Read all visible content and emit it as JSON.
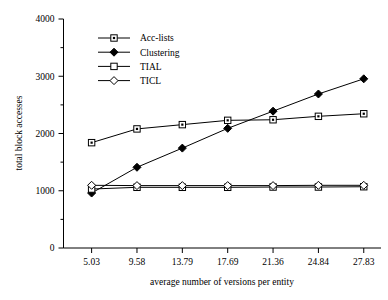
{
  "chart_data": {
    "type": "line",
    "title": "",
    "xlabel": "average number of versions per entity",
    "ylabel": "total block accesses",
    "categories": [
      "5.03",
      "9.58",
      "13.79",
      "17.69",
      "21.36",
      "24.84",
      "27.83"
    ],
    "x_tick_labels": [
      "5.03",
      "9.58",
      "13.79",
      "17.69",
      "21.36",
      "24.84",
      "27.83"
    ],
    "y_tick_labels": [
      "0",
      "1000",
      "2000",
      "3000",
      "4000"
    ],
    "y_tick_values": [
      0,
      1000,
      2000,
      3000,
      4000
    ],
    "y_minor_tick_values": [
      500,
      1500,
      2500,
      3500
    ],
    "ylim": [
      0,
      4000
    ],
    "grid": false,
    "legend_position": "top-left-inside",
    "series": [
      {
        "name": "Acc-lists",
        "marker": "square-dot",
        "values": [
          1840,
          2080,
          2155,
          2230,
          2240,
          2300,
          2345
        ]
      },
      {
        "name": "Clustering",
        "marker": "diamond-filled",
        "values": [
          960,
          1410,
          1745,
          2090,
          2390,
          2690,
          2955
        ]
      },
      {
        "name": "TIAL",
        "marker": "square-open",
        "values": [
          1030,
          1060,
          1060,
          1060,
          1065,
          1065,
          1070
        ]
      },
      {
        "name": "TICL",
        "marker": "diamond-open",
        "values": [
          1095,
          1090,
          1090,
          1090,
          1090,
          1095,
          1095
        ]
      }
    ],
    "colors": {
      "line": "#000000",
      "marker_fill": "#ffffff",
      "background": "#ffffff"
    }
  }
}
